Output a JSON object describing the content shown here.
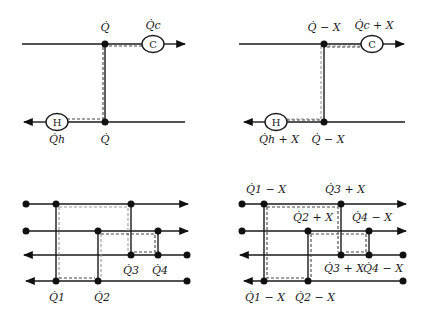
{
  "panels": {
    "top_left": {
      "cold_utility_symbol": "C",
      "hot_utility_symbol": "H",
      "label_top_match": "Q̇",
      "label_cold_utility": "Q̇c",
      "label_hot_utility": "Q̇h",
      "label_bottom_match": "Q̇"
    },
    "top_right": {
      "cold_utility_symbol": "C",
      "hot_utility_symbol": "H",
      "label_top_match": "Q̇ − X",
      "label_cold_utility": "Q̇c + X",
      "label_hot_utility": "Q̇h + X",
      "label_bottom_match": "Q̇ − X"
    },
    "bottom_left": {
      "labels": [
        "Q̇1",
        "Q̇2",
        "Q̇3",
        "Q̇4"
      ]
    },
    "bottom_right": {
      "labels": {
        "q1_top": "Q̇1 − X",
        "q3_top": "Q̇3 + X",
        "q2_top": "Q̇2 + X",
        "q4_top": "Q̇4 − X",
        "q3_bottom": "Q̇3 + X",
        "q4_bottom": "Q̇4 − X",
        "q1_bottom": "Q̇1 − X",
        "q2_bottom": "Q̇2 − X"
      }
    }
  }
}
